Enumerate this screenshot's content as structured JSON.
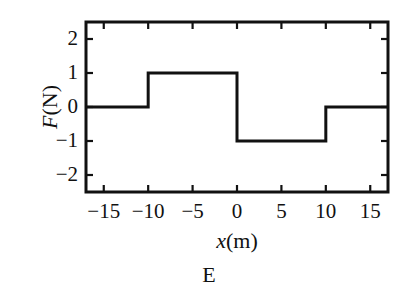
{
  "figure": {
    "caption": "E",
    "background_color": "#ffffff",
    "line_color": "#111111"
  },
  "chart_data": {
    "type": "line",
    "title": "",
    "subtitle": "",
    "xlabel_parts": {
      "variable": "x",
      "units": "(m)"
    },
    "ylabel_parts": {
      "variable": "F",
      "units": "(N)"
    },
    "xlabel": "x(m)",
    "ylabel": "F(N)",
    "xlim": [
      -17,
      17
    ],
    "ylim": [
      -2.5,
      2.5
    ],
    "xticks": [
      -15,
      -10,
      -5,
      0,
      5,
      10,
      15
    ],
    "xtick_labels": [
      "−15",
      "−10",
      "−5",
      "0",
      "5",
      "10",
      "15"
    ],
    "yticks": [
      -2,
      -1,
      0,
      1,
      2
    ],
    "ytick_labels": [
      "−2",
      "−1",
      "0",
      "1",
      "2"
    ],
    "grid": false,
    "legend": null,
    "step_style": "post",
    "segments": [
      {
        "x_start": -17,
        "x_end": -10,
        "value": 0
      },
      {
        "x_start": -10,
        "x_end": 0,
        "value": 1
      },
      {
        "x_start": 0,
        "x_end": 10,
        "value": -1
      },
      {
        "x_start": 10,
        "x_end": 17,
        "value": 0
      }
    ],
    "x": [
      -17,
      -10,
      -10,
      0,
      0,
      10,
      10,
      17
    ],
    "y": [
      0,
      0,
      1,
      1,
      -1,
      -1,
      0,
      0
    ],
    "annotations": []
  }
}
